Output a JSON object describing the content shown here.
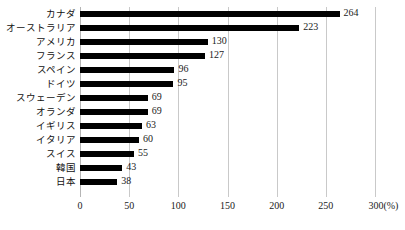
{
  "chart_data": {
    "type": "bar",
    "orientation": "horizontal",
    "title": "",
    "xlabel": "(%)",
    "ylabel": "",
    "xlim": [
      0,
      300
    ],
    "grid": true,
    "legend": null,
    "axis_unit_label": "(%)",
    "categories": [
      "カナダ",
      "オーストラリア",
      "アメリカ",
      "フランス",
      "スペイン",
      "ドイツ",
      "スウェーデン",
      "オランダ",
      "イギリス",
      "イタリア",
      "スイス",
      "韓国",
      "日本"
    ],
    "values": [
      264,
      223,
      130,
      127,
      96,
      95,
      69,
      69,
      63,
      60,
      55,
      43,
      38
    ],
    "value_labels": [
      "264",
      "223",
      "130",
      "127",
      "96",
      "95",
      "69",
      "69",
      "63",
      "60",
      "55",
      "43",
      "38"
    ],
    "xticks": [
      0,
      50,
      100,
      150,
      200,
      250,
      300
    ],
    "xtick_labels": [
      "0",
      "50",
      "100",
      "150",
      "200",
      "250",
      "300(%)"
    ],
    "colors": {
      "bar": "#000000",
      "gridline": "#c9c9c9",
      "background": "#ffffff",
      "text": "#1a1a1a"
    }
  }
}
